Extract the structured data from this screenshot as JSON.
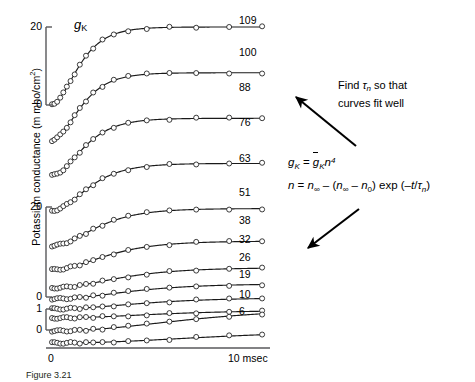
{
  "figure": {
    "inplot_label": {
      "symbol": "g",
      "subscript": "K"
    },
    "y_axis": {
      "title_text": "Potassium conductance (m mho/cm",
      "title_sup": "2",
      "title_tail": ")",
      "scales": [
        {
          "top_label": "20",
          "bottom_label": "0"
        },
        {
          "top_label": "20",
          "bottom_label": "0"
        },
        {
          "top_label": "1",
          "bottom_label": "0"
        }
      ]
    },
    "x_axis": {
      "start_label": "0",
      "end_label": "10 msec"
    },
    "curve_labels": [
      "109",
      "100",
      "88",
      "76",
      "63",
      "51",
      "38",
      "32",
      "26",
      "19",
      "10",
      "6"
    ],
    "caption": "Figure 3.21"
  },
  "annotation": {
    "note_line1_pre": "Find ",
    "note_tau": "τ",
    "note_tau_sub": "n",
    "note_line1_post": " so that",
    "note_line2": "curves fit well",
    "equation_1": "gK = gK n4",
    "equation_2": "n = n∞ − (n∞ − n0) exp (−t/τn)"
  },
  "chart_data": {
    "type": "line",
    "xlabel": "time",
    "ylabel": "Potassium conductance (m mho/cm2)",
    "xlim": [
      0,
      11
    ],
    "xtick_labels": [
      "0",
      "10 msec"
    ],
    "ylim": [
      0,
      20
    ],
    "ytick_labels": [
      "0",
      "20",
      "0",
      "20",
      "0",
      "1"
    ],
    "grid": false,
    "legend": "right-of-curve labels (depolarization in mV)",
    "marker": "open-circle",
    "series": [
      {
        "name": "109",
        "plateau": 20.0,
        "tau": 0.9,
        "n0": 0.31,
        "baseline_index": 0
      },
      {
        "name": "100",
        "plateau": 17.5,
        "tau": 0.95,
        "n0": 0.3,
        "baseline_index": 1
      },
      {
        "name": "88",
        "plateau": 14.8,
        "tau": 1.05,
        "n0": 0.29,
        "baseline_index": 2
      },
      {
        "name": "76",
        "plateau": 12.2,
        "tau": 1.2,
        "n0": 0.28,
        "baseline_index": 3
      },
      {
        "name": "63",
        "plateau": 9.6,
        "tau": 1.45,
        "n0": 0.27,
        "baseline_index": 4
      },
      {
        "name": "51",
        "plateau": 7.4,
        "tau": 1.75,
        "n0": 0.26,
        "baseline_index": 5
      },
      {
        "name": "38",
        "plateau": 5.2,
        "tau": 2.15,
        "n0": 0.25,
        "baseline_index": 6
      },
      {
        "name": "32",
        "plateau": 3.9,
        "tau": 2.45,
        "n0": 0.24,
        "baseline_index": 7
      },
      {
        "name": "26",
        "plateau": 2.9,
        "tau": 2.8,
        "n0": 0.23,
        "baseline_index": 8
      },
      {
        "name": "19",
        "plateau": 2.0,
        "tau": 3.3,
        "n0": 0.22,
        "baseline_index": 9
      },
      {
        "name": "10",
        "plateau": 1.1,
        "tau": 4.2,
        "n0": 0.2,
        "baseline_index": 10
      },
      {
        "name": "6",
        "plateau": 0.62,
        "tau": 5.0,
        "n0": 0.18,
        "baseline_index": 11
      }
    ]
  }
}
